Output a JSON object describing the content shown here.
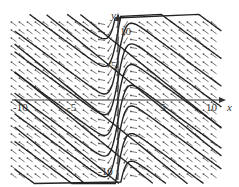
{
  "figure": {
    "type": "direction-field",
    "axes": {
      "x_label": "x",
      "y_label": "y",
      "x_ticks": [
        {
          "value": -10,
          "label": "-10"
        },
        {
          "value": -5,
          "label": "-5"
        },
        {
          "value": 5,
          "label": "5"
        },
        {
          "value": 10,
          "label": "10"
        }
      ],
      "y_ticks": [
        {
          "value": 10,
          "label": "10"
        },
        {
          "value": 5,
          "label": "5"
        },
        {
          "value": -10,
          "label": "-10"
        }
      ],
      "x_range": [
        -11,
        12
      ],
      "y_range": [
        -12,
        13
      ]
    },
    "colors": {
      "curve": "#222222",
      "arrow": "#555555",
      "axis": "#333333"
    }
  }
}
